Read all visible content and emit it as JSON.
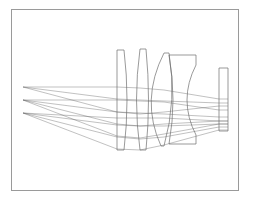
{
  "diagram": {
    "frame": {
      "x": 11.5,
      "y": 9.5,
      "w": 227,
      "h": 181,
      "color": "#9a9a9a"
    },
    "colors": {
      "lens": "#6e6e6e",
      "ray": "#5c5c5c",
      "background": "#ffffff"
    },
    "elements": [
      {
        "name": "lens-element-1",
        "path": "M117,50 L124,50 Q130,100 124,150 L117,150 Z"
      },
      {
        "name": "lens-element-2",
        "path": "M140,49 L146,49 Q151,100 146,150 L140,150 Q133,100 140,49 Z"
      },
      {
        "name": "lens-element-3",
        "path": "M164,53 L169,53 Q177,100 164,146 L161,146 Q140,100 164,53 Z"
      },
      {
        "name": "lens-element-4",
        "path": "M169,55 L196,55 L196,65 Q178,100 196,135 L196,144 L169,144 Q177,100 169,55 Z"
      },
      {
        "name": "sensor-window",
        "path": "M219,68 L228,68 L228,131 L219,131 Z"
      }
    ],
    "field_sources": [
      {
        "label": "field-1",
        "x": 23,
        "y": 87
      },
      {
        "label": "field-2",
        "x": 23,
        "y": 100
      },
      {
        "label": "field-3",
        "x": 23,
        "y": 113
      }
    ],
    "rays": [
      "M23,87 L117,87 L140,88 L164,90 L219,99 L228,99",
      "M23,87 L117,99 L140,100 L164,101 L219,103 L228,103",
      "M23,87 L117,112 L140,114 L164,112 L219,106 L228,106",
      "M23,100 L117,100 L140,101 L164,102 L219,110 L228,110",
      "M23,100 L117,112 L140,113 L164,114 L219,117 L228,117",
      "M23,100 L117,124 L140,126 L164,124 L219,121 L228,121",
      "M23,100 L117,136 L140,138 L164,134 L219,124 L228,124",
      "M23,113 L117,125 L140,126 L164,126 L219,124 L228,124",
      "M23,113 L117,137 L140,139 L164,137 L219,127 L228,127",
      "M23,113 L117,149 L140,150 L164,145 L219,130 L228,130",
      "M23,113 L117,118 L140,118 L164,118 L219,121 L228,121"
    ]
  }
}
